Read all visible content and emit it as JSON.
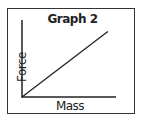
{
  "chart_data": {
    "type": "line",
    "title": "Graph 2",
    "xlabel": "Mass",
    "ylabel": "Force",
    "grid": false,
    "legend": null,
    "series": [
      {
        "name": "Force vs Mass",
        "x": [
          0,
          1
        ],
        "y": [
          0,
          0.85
        ]
      }
    ],
    "xlim": [
      0,
      1
    ],
    "ylim": [
      0,
      1
    ]
  },
  "colors": {
    "line": "#222222",
    "frame": "#333333"
  }
}
